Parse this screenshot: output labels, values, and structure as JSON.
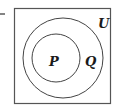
{
  "diagram": {
    "type": "venn",
    "universe_label": "U",
    "sets": [
      {
        "label": "P",
        "relation": "subset of Q"
      },
      {
        "label": "Q",
        "relation": "subset of U"
      }
    ],
    "stroke_color": "#444444",
    "background": "#ffffff"
  }
}
